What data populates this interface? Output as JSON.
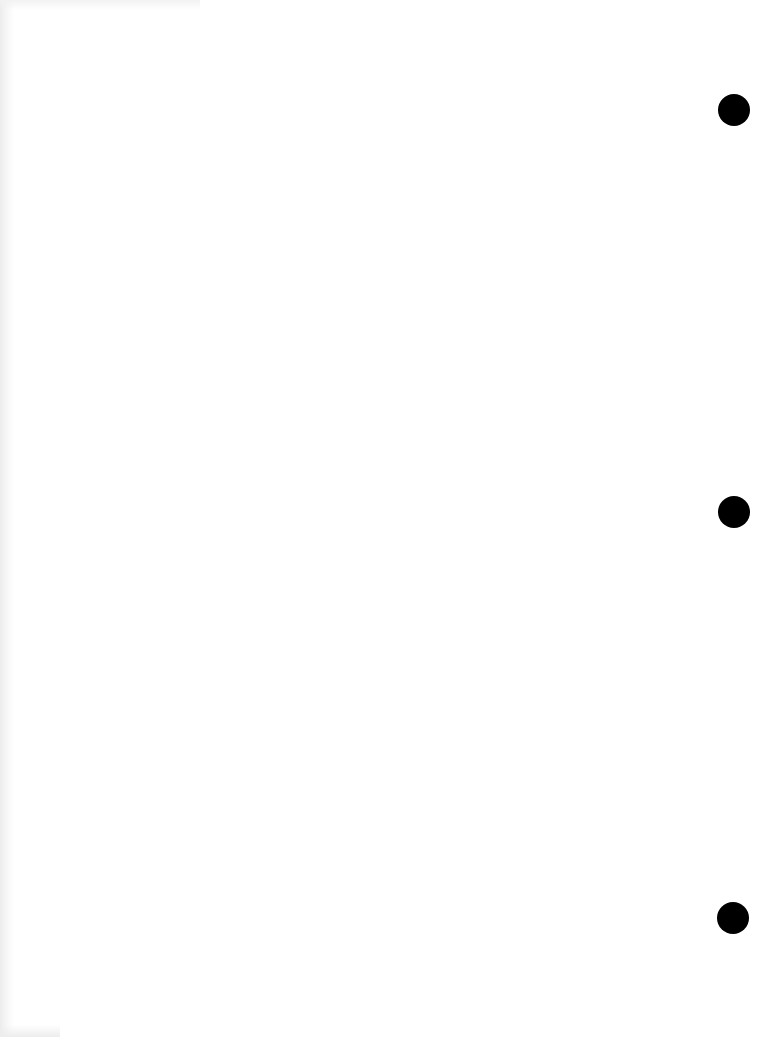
{
  "document": {
    "type": "blank scanned page",
    "text_content": "",
    "background_color": "#ffffff",
    "edge_shading_color": "#ececec"
  },
  "punch_holes": {
    "count": 3,
    "color": "#000000",
    "diameter_px": 32,
    "side": "right",
    "holes": [
      {
        "center_x": 734,
        "center_y": 110
      },
      {
        "center_x": 734,
        "center_y": 512
      },
      {
        "center_x": 733,
        "center_y": 918
      }
    ]
  }
}
